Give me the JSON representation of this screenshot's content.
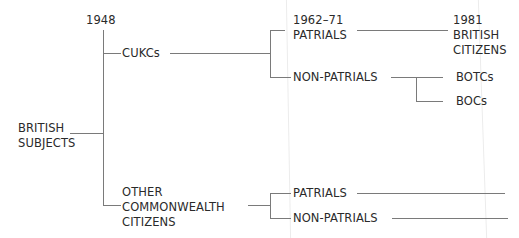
{
  "diagram": {
    "type": "tree",
    "nodes": {
      "year_1948": "1948",
      "british_subjects": "BRITISH\nSUBJECTS",
      "cukcs": "CUKCs",
      "other_commonwealth": "OTHER\nCOMMONWEALTH\nCITIZENS",
      "patrials_1962": "1962–71\nPATRIALS",
      "non_patrials_1": "NON-PATRIALS",
      "british_citizens_1981": "1981\nBRITISH\nCITIZENS",
      "botcs": "BOTCs",
      "bocs": "BOCs",
      "patrials_2": "PATRIALS",
      "non_patrials_2": "NON-PATRIALS"
    },
    "edges": [
      [
        "british_subjects",
        "cukcs"
      ],
      [
        "british_subjects",
        "other_commonwealth"
      ],
      [
        "cukcs",
        "patrials_1962"
      ],
      [
        "cukcs",
        "non_patrials_1"
      ],
      [
        "patrials_1962",
        "british_citizens_1981"
      ],
      [
        "non_patrials_1",
        "botcs"
      ],
      [
        "non_patrials_1",
        "bocs"
      ],
      [
        "other_commonwealth",
        "patrials_2"
      ],
      [
        "other_commonwealth",
        "non_patrials_2"
      ]
    ],
    "colors": {
      "line": "#7a7a7a",
      "text": "#2a2a2a",
      "background": "#ffffff"
    }
  }
}
